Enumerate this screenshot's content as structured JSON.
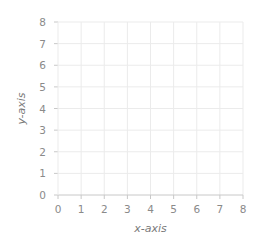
{
  "chart_data": {
    "type": "scatter",
    "title": "",
    "xlabel": "x-axis",
    "ylabel": "y-axis",
    "xlim": [
      0,
      8
    ],
    "ylim": [
      0,
      8
    ],
    "x_ticks": [
      "0",
      "1",
      "2",
      "3",
      "4",
      "5",
      "6",
      "7",
      "8"
    ],
    "y_ticks": [
      "0",
      "1",
      "2",
      "3",
      "4",
      "5",
      "6",
      "7",
      "8"
    ],
    "grid": true,
    "series": []
  },
  "colors": {
    "grid": "#ebebeb",
    "axis": "#c8c8c8",
    "tick_text": "#8a8a8a",
    "label_text": "#7a7a7a"
  }
}
